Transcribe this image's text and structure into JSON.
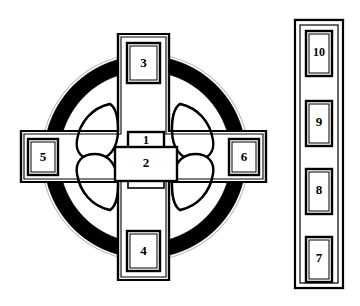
{
  "figure": {
    "background_color": "#ffffff",
    "line_color": "#000000",
    "fill_color": "#ffffff",
    "solid_fill_color": "#000000"
  },
  "cruciform_structure": {
    "name": "cruciform-plan",
    "ring": {
      "name": "circular-ring-wall",
      "center": {
        "x": 145,
        "y": 157
      },
      "outer_radius": 101,
      "inner_radius": 86,
      "fill": "#000000"
    },
    "central_block": {
      "name": "central-block",
      "rooms": [
        {
          "id": "1",
          "label": "1",
          "shape": "rectangle",
          "x": 128,
          "y": 133,
          "width": 36,
          "height": 15
        },
        {
          "id": "2",
          "label": "2",
          "shape": "rectangle",
          "x": 116,
          "y": 147,
          "width": 59,
          "height": 34
        }
      ],
      "south_stub": {
        "name": "central-block-south-stub",
        "x": 128,
        "y": 181,
        "width": 36,
        "height": 7
      }
    },
    "arms": [
      {
        "id": "north-arm",
        "name": "north-arm",
        "direction": "north",
        "outer": {
          "x": 118,
          "y": 34,
          "width": 51,
          "height": 72
        },
        "chamber": {
          "id": "3",
          "label": "3",
          "x": 127,
          "y": 43,
          "width": 33,
          "height": 40
        }
      },
      {
        "id": "south-arm",
        "name": "south-arm",
        "direction": "south",
        "outer": {
          "x": 118,
          "y": 208,
          "width": 51,
          "height": 72
        },
        "chamber": {
          "id": "4",
          "label": "4",
          "x": 127,
          "y": 231,
          "width": 33,
          "height": 40
        }
      },
      {
        "id": "west-arm",
        "name": "west-arm",
        "direction": "west",
        "outer": {
          "x": 21,
          "y": 131,
          "width": 72,
          "height": 51
        },
        "chamber": {
          "id": "5",
          "label": "5",
          "x": 28,
          "y": 139,
          "width": 30,
          "height": 36
        }
      },
      {
        "id": "east-arm",
        "name": "east-arm",
        "direction": "east",
        "outer": {
          "x": 194,
          "y": 131,
          "width": 72,
          "height": 51
        },
        "chamber": {
          "id": "6",
          "label": "6",
          "x": 229,
          "y": 139,
          "width": 30,
          "height": 36
        }
      }
    ],
    "quadrant_lobes": [
      {
        "id": "nw-lobe",
        "name": "northwest-lobe",
        "quadrant": "northwest"
      },
      {
        "id": "ne-lobe",
        "name": "northeast-lobe",
        "quadrant": "northeast"
      },
      {
        "id": "sw-lobe",
        "name": "southwest-lobe",
        "quadrant": "southwest"
      },
      {
        "id": "se-lobe",
        "name": "southeast-lobe",
        "quadrant": "southeast"
      }
    ]
  },
  "linear_structure": {
    "name": "linear-chamber-block",
    "outer": {
      "x": 295,
      "y": 20,
      "width": 48,
      "height": 268
    },
    "inner": {
      "x": 300,
      "y": 25,
      "width": 38,
      "height": 258
    },
    "chambers": [
      {
        "id": "10",
        "label": "10",
        "x": 307,
        "y": 32,
        "width": 25,
        "height": 44
      },
      {
        "id": "9",
        "label": "9",
        "x": 307,
        "y": 103,
        "width": 25,
        "height": 44
      },
      {
        "id": "8",
        "label": "8",
        "x": 307,
        "y": 170,
        "width": 25,
        "height": 44
      },
      {
        "id": "7",
        "label": "7",
        "x": 307,
        "y": 238,
        "width": 25,
        "height": 44
      }
    ],
    "partition_masses": [
      {
        "id": "partition-1",
        "name": "partition-mass-upper",
        "y": 89,
        "rx": 11,
        "ry": 9
      },
      {
        "id": "partition-2",
        "name": "partition-mass-middle",
        "y": 157,
        "rx": 11,
        "ry": 9
      },
      {
        "id": "partition-3",
        "name": "partition-mass-lower",
        "y": 225,
        "rx": 11,
        "ry": 9
      }
    ]
  },
  "room_numbers": [
    "1",
    "2",
    "3",
    "4",
    "5",
    "6",
    "7",
    "8",
    "9",
    "10"
  ]
}
